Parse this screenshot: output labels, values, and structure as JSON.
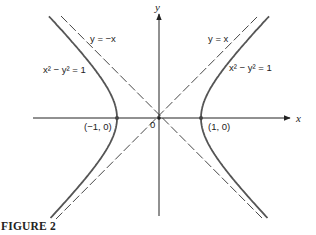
{
  "caption": "FIGURE 2",
  "axes": {
    "x_label": "x",
    "y_label": "y",
    "origin_label": "0"
  },
  "asymptotes": [
    {
      "label": "y = −x",
      "equation": "y=-x",
      "style": "dashed"
    },
    {
      "label": "y = x",
      "equation": "y=x",
      "style": "dashed"
    }
  ],
  "curve": {
    "equation_label_left": "x² − y² = 1",
    "equation_label_right": "x² − y² = 1",
    "vertices": [
      {
        "label": "(−1, 0)",
        "x": -1,
        "y": 0
      },
      {
        "label": "(1, 0)",
        "x": 1,
        "y": 0
      }
    ]
  },
  "colors": {
    "curve": "#555555",
    "axes": "#222222",
    "asymptote": "#333333"
  }
}
